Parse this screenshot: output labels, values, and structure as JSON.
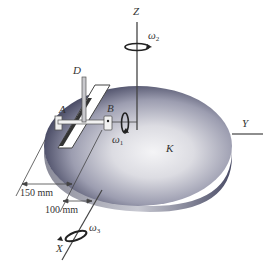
{
  "figure": {
    "type": "rigid-body kinematics diagram",
    "body_label": "K",
    "points": {
      "A": "A",
      "B": "B",
      "D": "D"
    },
    "axes": {
      "x": "X",
      "y": "Y",
      "z": "Z"
    },
    "angular_velocities": {
      "w1": {
        "symbol": "ω",
        "sub": "1"
      },
      "w2": {
        "symbol": "ω",
        "sub": "2"
      },
      "w3": {
        "symbol": "ω",
        "sub": "3"
      }
    },
    "dimensions": {
      "d1": "150 mm",
      "d2": "100 mm"
    },
    "colors": {
      "disk_light": "#f2f2f4",
      "disk_mid": "#a8a9b5",
      "disk_dark": "#3a3c55",
      "line": "#333333"
    }
  }
}
